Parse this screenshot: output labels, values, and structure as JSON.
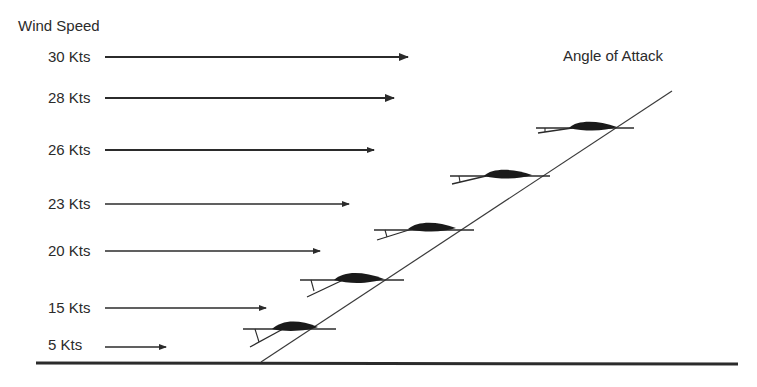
{
  "diagram": {
    "left_title": "Wind Speed",
    "right_title": "Angle of Attack",
    "wind_speeds": [
      {
        "label": "30 Kts",
        "knots": 30
      },
      {
        "label": "28 Kts",
        "knots": 28
      },
      {
        "label": "26 Kts",
        "knots": 26
      },
      {
        "label": "23 Kts",
        "knots": 23
      },
      {
        "label": "20 Kts",
        "knots": 20
      },
      {
        "label": "15 Kts",
        "knots": 15
      },
      {
        "label": "5 Kts",
        "knots": 5
      }
    ],
    "kites_shown": 5,
    "colors": {
      "ink": "#2b2b2b",
      "background": "#ffffff"
    }
  }
}
